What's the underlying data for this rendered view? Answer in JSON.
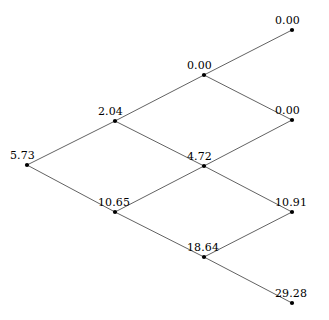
{
  "figure": {
    "kind": "binomial-lattice",
    "background_color": "#ffffff",
    "edge_color": "#3a3a3a",
    "node_color": "#000000",
    "label_color": "#000000",
    "width": 329,
    "height": 320
  },
  "chart_data": {
    "type": "scatter",
    "title": "",
    "subtitle": "",
    "xlabel": "",
    "ylabel": "",
    "grid": false,
    "legend": null,
    "layout": "binomial lattice, 4 time steps, values increase downward",
    "steps": 4,
    "nodes": [
      {
        "id": "n0_0",
        "step": 0,
        "level": 0,
        "value": "5.73",
        "x": 27,
        "y": 165,
        "label_anchor": "above-left"
      },
      {
        "id": "n1_0",
        "step": 1,
        "level": 0,
        "value": "2.04",
        "x": 115,
        "y": 121,
        "label_anchor": "above-left"
      },
      {
        "id": "n1_1",
        "step": 1,
        "level": 1,
        "value": "10.65",
        "x": 115,
        "y": 212,
        "label_anchor": "above-left"
      },
      {
        "id": "n2_0",
        "step": 2,
        "level": 0,
        "value": "0.00",
        "x": 204,
        "y": 75,
        "label_anchor": "above-left"
      },
      {
        "id": "n2_1",
        "step": 2,
        "level": 1,
        "value": "4.72",
        "x": 204,
        "y": 166,
        "label_anchor": "above-left"
      },
      {
        "id": "n2_2",
        "step": 2,
        "level": 2,
        "value": "18.64",
        "x": 204,
        "y": 257,
        "label_anchor": "above-left"
      },
      {
        "id": "n3_0",
        "step": 3,
        "level": 0,
        "value": "0.00",
        "x": 292,
        "y": 30,
        "label_anchor": "above-left"
      },
      {
        "id": "n3_1",
        "step": 3,
        "level": 1,
        "value": "0.00",
        "x": 292,
        "y": 120,
        "label_anchor": "above-left"
      },
      {
        "id": "n3_2",
        "step": 3,
        "level": 2,
        "value": "10.91",
        "x": 292,
        "y": 212,
        "label_anchor": "above-left"
      },
      {
        "id": "n3_3",
        "step": 3,
        "level": 3,
        "value": "29.28",
        "x": 292,
        "y": 303,
        "label_anchor": "above-left"
      }
    ],
    "edges": [
      {
        "from": "n0_0",
        "to": "n1_0"
      },
      {
        "from": "n0_0",
        "to": "n1_1"
      },
      {
        "from": "n1_0",
        "to": "n2_0"
      },
      {
        "from": "n1_0",
        "to": "n2_1"
      },
      {
        "from": "n1_1",
        "to": "n2_1"
      },
      {
        "from": "n1_1",
        "to": "n2_2"
      },
      {
        "from": "n2_0",
        "to": "n3_0"
      },
      {
        "from": "n2_0",
        "to": "n3_1"
      },
      {
        "from": "n2_1",
        "to": "n3_1"
      },
      {
        "from": "n2_1",
        "to": "n3_2"
      },
      {
        "from": "n2_2",
        "to": "n3_2"
      },
      {
        "from": "n2_2",
        "to": "n3_3"
      }
    ],
    "values_by_step": [
      [
        "5.73"
      ],
      [
        "2.04",
        "10.65"
      ],
      [
        "0.00",
        "4.72",
        "18.64"
      ],
      [
        "0.00",
        "0.00",
        "10.91",
        "29.28"
      ]
    ]
  }
}
